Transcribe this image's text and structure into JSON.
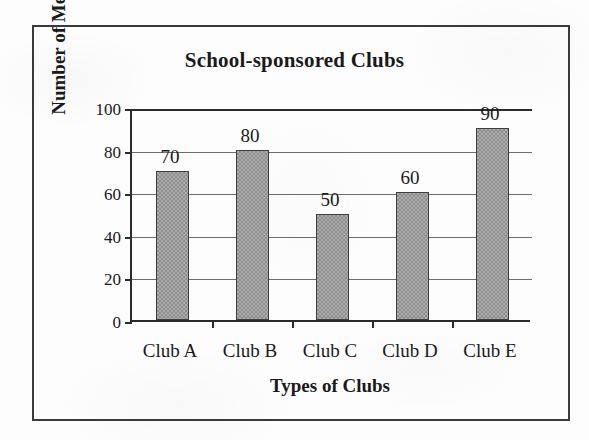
{
  "figure": {
    "frame": true,
    "border_color": "#3a3a3a",
    "background": "#fdfdfd"
  },
  "chart_data": {
    "type": "bar",
    "title": "School-sponsored Clubs",
    "xlabel": "Types of Clubs",
    "ylabel": "Number of Members",
    "categories": [
      "Club A",
      "Club B",
      "Club C",
      "Club D",
      "Club E"
    ],
    "values": [
      70,
      80,
      50,
      60,
      90
    ],
    "data_labels": [
      "70",
      "80",
      "50",
      "60",
      "90"
    ],
    "ylim": [
      0,
      100
    ],
    "ytick_labels": [
      "0",
      "20",
      "40",
      "60",
      "80",
      "100"
    ],
    "ytick_values": [
      0,
      20,
      40,
      60,
      80,
      100
    ],
    "grid": "horizontal",
    "legend": "none",
    "bar_fill": "#9d9d9d",
    "bar_border": "#3f3f3f",
    "axis_color": "#2b2b2b",
    "gridline_color": "#6d6d6d"
  }
}
